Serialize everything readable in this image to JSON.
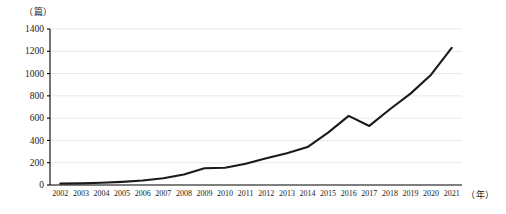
{
  "chart_data": {
    "type": "line",
    "title": "",
    "xlabel": "（年）",
    "ylabel": "（篇）",
    "x": [
      2002,
      2003,
      2004,
      2005,
      2006,
      2007,
      2008,
      2009,
      2010,
      2011,
      2012,
      2013,
      2014,
      2015,
      2016,
      2017,
      2018,
      2019,
      2020,
      2021
    ],
    "categories": [
      "2002",
      "2003",
      "2004",
      "2005",
      "2006",
      "2007",
      "2008",
      "2009",
      "2010",
      "2011",
      "2012",
      "2013",
      "2014",
      "2015",
      "2016",
      "2017",
      "2018",
      "2019",
      "2020",
      "2021"
    ],
    "values": [
      12,
      15,
      20,
      28,
      40,
      60,
      95,
      150,
      155,
      190,
      240,
      285,
      340,
      470,
      620,
      530,
      680,
      820,
      990,
      1230
    ],
    "series": [
      {
        "name": "",
        "values": [
          12,
          15,
          20,
          28,
          40,
          60,
          95,
          150,
          155,
          190,
          240,
          285,
          340,
          470,
          620,
          530,
          680,
          820,
          990,
          1230
        ]
      }
    ],
    "ylim": [
      0,
      1400
    ],
    "yticks": [
      0,
      200,
      400,
      600,
      800,
      1000,
      1200,
      1400
    ],
    "ytick_labels": [
      "0",
      "200",
      "400",
      "600",
      "800",
      "1000",
      "1200",
      "1400"
    ],
    "grid": true,
    "grid_axis": "y",
    "legend": false,
    "legend_position": "none",
    "line_color": "#1a1a1a",
    "grid_color": "#d9d9d9",
    "axis_color": "#000000"
  }
}
